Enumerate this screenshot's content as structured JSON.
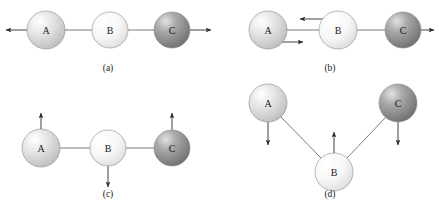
{
  "figure": {
    "caption_labels": [
      "(a)",
      "(b)",
      "(c)",
      "(d)"
    ],
    "atoms": {
      "a": "A",
      "b": "B",
      "c": "C"
    },
    "colors": {
      "background": "#ffffff",
      "atom_a_fill": "#d8d8d8",
      "atom_b_fill": "#f2f2f2",
      "atom_c_fill": "#9a9a9a",
      "bond_stroke": "#5a5a5a",
      "arrow_stroke": "#2b2b2b",
      "text": "#1a1a1a"
    }
  },
  "panels": [
    {
      "id": "a",
      "label": "(a)",
      "label_x": 108,
      "label_y": 68,
      "geometry": "linear",
      "atoms": [
        {
          "name": "A",
          "cx": 46,
          "cy": 30,
          "r": 19,
          "shade": "light"
        },
        {
          "name": "B",
          "cx": 110,
          "cy": 30,
          "r": 18,
          "shade": "pale"
        },
        {
          "name": "C",
          "cx": 172,
          "cy": 30,
          "r": 18,
          "shade": "dark"
        }
      ],
      "bonds": [
        {
          "x1": 65,
          "y1": 30,
          "x2": 92,
          "y2": 30
        },
        {
          "x1": 128,
          "y1": 30,
          "x2": 154,
          "y2": 30
        }
      ],
      "arrows": [
        {
          "name": "arrow-a-left",
          "x1": 27,
          "y1": 30,
          "x2": 6,
          "y2": 30
        },
        {
          "name": "arrow-c-right",
          "x1": 190,
          "y1": 30,
          "x2": 211,
          "y2": 30
        }
      ]
    },
    {
      "id": "b",
      "label": "(b)",
      "label_x": 330,
      "label_y": 68,
      "geometry": "linear",
      "atoms": [
        {
          "name": "A",
          "cx": 268,
          "cy": 30,
          "r": 19,
          "shade": "light"
        },
        {
          "name": "B",
          "cx": 338,
          "cy": 30,
          "r": 19,
          "shade": "pale"
        },
        {
          "name": "C",
          "cx": 403,
          "cy": 30,
          "r": 18,
          "shade": "dark"
        }
      ],
      "bonds": [
        {
          "x1": 287,
          "y1": 30,
          "x2": 319,
          "y2": 30
        },
        {
          "x1": 357,
          "y1": 30,
          "x2": 385,
          "y2": 30
        }
      ],
      "arrows": [
        {
          "name": "arrow-b-left",
          "x1": 326,
          "y1": 19,
          "x2": 300,
          "y2": 19
        },
        {
          "name": "arrow-a-right",
          "x1": 278,
          "y1": 42,
          "x2": 303,
          "y2": 42
        },
        {
          "name": "arrow-c-right",
          "x1": 421,
          "y1": 30,
          "x2": 434,
          "y2": 30
        }
      ]
    },
    {
      "id": "c",
      "label": "(c)",
      "label_x": 108,
      "label_y": 194,
      "geometry": "linear",
      "atoms": [
        {
          "name": "A",
          "cx": 41,
          "cy": 148,
          "r": 19,
          "shade": "light"
        },
        {
          "name": "B",
          "cx": 108,
          "cy": 148,
          "r": 18,
          "shade": "pale"
        },
        {
          "name": "C",
          "cx": 172,
          "cy": 148,
          "r": 18,
          "shade": "dark"
        }
      ],
      "bonds": [
        {
          "x1": 60,
          "y1": 148,
          "x2": 90,
          "y2": 148
        },
        {
          "x1": 126,
          "y1": 148,
          "x2": 154,
          "y2": 148
        }
      ],
      "arrows": [
        {
          "name": "arrow-a-up",
          "x1": 41,
          "y1": 129,
          "x2": 41,
          "y2": 113
        },
        {
          "name": "arrow-c-up",
          "x1": 172,
          "y1": 130,
          "x2": 172,
          "y2": 113
        },
        {
          "name": "arrow-b-down",
          "x1": 108,
          "y1": 166,
          "x2": 108,
          "y2": 187
        }
      ]
    },
    {
      "id": "d",
      "label": "(d)",
      "label_x": 330,
      "label_y": 194,
      "geometry": "bent",
      "atoms": [
        {
          "name": "A",
          "cx": 268,
          "cy": 103,
          "r": 19,
          "shade": "light"
        },
        {
          "name": "B",
          "cx": 334,
          "cy": 172,
          "r": 19,
          "shade": "pale"
        },
        {
          "name": "C",
          "cx": 398,
          "cy": 103,
          "r": 19,
          "shade": "dark"
        }
      ],
      "bonds": [
        {
          "x1": 281,
          "y1": 117,
          "x2": 321,
          "y2": 158
        },
        {
          "x1": 347,
          "y1": 158,
          "x2": 386,
          "y2": 117
        }
      ],
      "arrows": [
        {
          "name": "arrow-a-down",
          "x1": 268,
          "y1": 122,
          "x2": 268,
          "y2": 145
        },
        {
          "name": "arrow-c-down",
          "x1": 398,
          "y1": 122,
          "x2": 398,
          "y2": 145
        },
        {
          "name": "arrow-b-up",
          "x1": 334,
          "y1": 153,
          "x2": 334,
          "y2": 132
        }
      ]
    }
  ]
}
